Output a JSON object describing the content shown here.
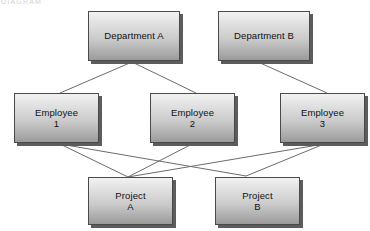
{
  "diagram": {
    "title_fragment": "DIAGRAM",
    "line_color": "#6b6b6b",
    "node_border_color": "#4a4a4a",
    "node_shadow_color": "#5c5c5c",
    "background_color": "#ffffff",
    "nodes": [
      {
        "id": "dept-a",
        "label_line1": "Department A",
        "label_line2": "",
        "x": 88,
        "y": 11,
        "w": 92,
        "h": 50
      },
      {
        "id": "dept-b",
        "label_line1": "Department B",
        "label_line2": "",
        "x": 218,
        "y": 11,
        "w": 92,
        "h": 50
      },
      {
        "id": "employee-1",
        "label_line1": "Employee",
        "label_line2": "1",
        "x": 14,
        "y": 93,
        "w": 85,
        "h": 50
      },
      {
        "id": "employee-2",
        "label_line1": "Employee",
        "label_line2": "2",
        "x": 150,
        "y": 93,
        "w": 85,
        "h": 50
      },
      {
        "id": "employee-3",
        "label_line1": "Employee",
        "label_line2": "3",
        "x": 280,
        "y": 93,
        "w": 85,
        "h": 50
      },
      {
        "id": "project-a",
        "label_line1": "Project",
        "label_line2": "A",
        "x": 88,
        "y": 177,
        "w": 85,
        "h": 48
      },
      {
        "id": "project-b",
        "label_line1": "Project",
        "label_line2": "B",
        "x": 215,
        "y": 177,
        "w": 85,
        "h": 48
      }
    ],
    "edges": [
      {
        "id": "dept-a-to-employee-1",
        "from": "dept-a",
        "to": "employee-1",
        "x1": 132,
        "y1": 62,
        "x2": 60,
        "y2": 93
      },
      {
        "id": "dept-a-to-employee-2",
        "from": "dept-a",
        "to": "employee-2",
        "x1": 132,
        "y1": 62,
        "x2": 196,
        "y2": 93
      },
      {
        "id": "dept-b-to-employee-3",
        "from": "dept-b",
        "to": "employee-3",
        "x1": 258,
        "y1": 62,
        "x2": 327,
        "y2": 93
      },
      {
        "id": "employee-1-to-project-a",
        "from": "employee-1",
        "to": "project-a",
        "x1": 60,
        "y1": 144,
        "x2": 128,
        "y2": 177
      },
      {
        "id": "employee-1-to-project-b",
        "from": "employee-1",
        "to": "project-b",
        "x1": 60,
        "y1": 144,
        "x2": 246,
        "y2": 176
      },
      {
        "id": "employee-2-to-project-a",
        "from": "employee-2",
        "to": "project-a",
        "x1": 192,
        "y1": 144,
        "x2": 128,
        "y2": 177
      },
      {
        "id": "employee-3-to-project-a",
        "from": "employee-3",
        "to": "project-a",
        "x1": 324,
        "y1": 144,
        "x2": 128,
        "y2": 177
      },
      {
        "id": "employee-3-to-project-b",
        "from": "employee-3",
        "to": "project-b",
        "x1": 324,
        "y1": 144,
        "x2": 246,
        "y2": 176
      }
    ]
  }
}
